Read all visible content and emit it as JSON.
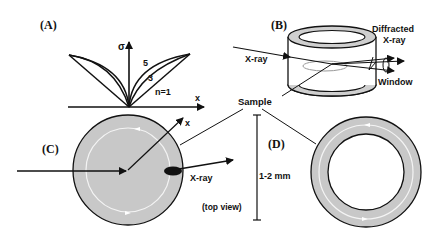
{
  "panels": {
    "a": {
      "label": "(A)",
      "y_axis": "σ",
      "x_axis": "x",
      "curves": [
        "5",
        "3",
        "n=1"
      ]
    },
    "b": {
      "label": "(B)",
      "incident": "X-ray",
      "diffracted_line1": "Diffracted",
      "diffracted_line2": "X-ray",
      "window": "Window"
    },
    "c": {
      "label": "(C)",
      "x_axis": "x",
      "xray": "X-ray",
      "view": "(top view)"
    },
    "d": {
      "label": "(D)"
    },
    "sample": "Sample",
    "scale": "1-2 mm"
  },
  "colors": {
    "sample_fill": "#c8c8c8",
    "stroke": "#111111",
    "ring_highlight": "#f4f4f4"
  }
}
